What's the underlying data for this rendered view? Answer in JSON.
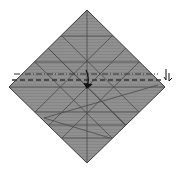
{
  "diagram": {
    "type": "origami-fold-diagram",
    "paper": {
      "shape": "diamond",
      "fill": "#8e8e8e",
      "edge": "#3a3a3a",
      "vertices": {
        "top": [
          87,
          10
        ],
        "right": [
          165,
          87
        ],
        "bottom": [
          87,
          163
        ],
        "left": [
          9,
          87
        ]
      }
    },
    "crease_color": "#4a4a4a",
    "folds": [
      {
        "kind": "mountain",
        "style": "dash-dot",
        "y": 74
      },
      {
        "kind": "valley",
        "style": "dashed",
        "y": 80
      }
    ],
    "arrows": [
      {
        "kind": "fold-arrow",
        "direction": "down",
        "position": [
          88,
          80
        ]
      },
      {
        "kind": "turn-over-arrow",
        "position": [
          168,
          76
        ]
      }
    ]
  }
}
